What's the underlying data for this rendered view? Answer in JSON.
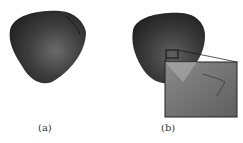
{
  "figure": {
    "panels": [
      {
        "id": "a",
        "label": "(a)",
        "description": "3D rendered dark grey curved surface (bowl/shell shape)"
      },
      {
        "id": "b",
        "label": "(b)",
        "description": "Same surface with a zoomed inset showing mesh detail"
      }
    ],
    "colors": {
      "surface": "#3a3a3a",
      "highlight": "#6a6a6a",
      "inset_bg": "#6b6b6b",
      "inset_border": "#222222"
    }
  }
}
